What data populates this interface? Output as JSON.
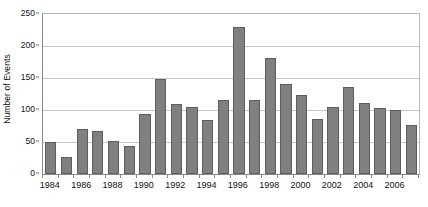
{
  "chart_data": {
    "type": "bar",
    "title": "",
    "subtitle": "",
    "xlabel": "",
    "ylabel": "Number of Events",
    "ylim": [
      0,
      250
    ],
    "ytick_values": [
      0,
      50,
      100,
      150,
      200,
      250
    ],
    "ytick_labels": [
      "0",
      "50",
      "100",
      "150",
      "200",
      "250"
    ],
    "xtick_labels": [
      "1984",
      "1986",
      "1988",
      "1990",
      "1992",
      "1994",
      "1996",
      "1998",
      "2000",
      "2002",
      "2004",
      "2006"
    ],
    "grid": true,
    "legend": false,
    "legend_position": "none",
    "bar_color": "#808080",
    "bar_edge_color": "#5e5e5e",
    "gridline_color": "#c9c9c9",
    "axis_color": "#8a8a8a",
    "categories": [
      "1984",
      "1985",
      "1986",
      "1987",
      "1988",
      "1989",
      "1990",
      "1991",
      "1992",
      "1993",
      "1994",
      "1995",
      "1996",
      "1997",
      "1998",
      "1999",
      "2000",
      "2001",
      "2002",
      "2003",
      "2004",
      "2005",
      "2006",
      "2007"
    ],
    "values": [
      50,
      26,
      71,
      67,
      51,
      44,
      94,
      149,
      110,
      105,
      84,
      115,
      230,
      115,
      182,
      140,
      123,
      86,
      105,
      136,
      111,
      103,
      100,
      76
    ]
  }
}
